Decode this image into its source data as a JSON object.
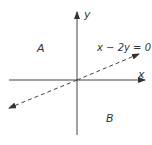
{
  "diagram": {
    "type": "coordinate-plane-with-line",
    "axes": {
      "x_label": "x",
      "y_label": "y"
    },
    "line": {
      "equation": "x − 2y = 0",
      "style": "dashed",
      "slope": 0.5,
      "intercept": 0
    },
    "regions": [
      {
        "label": "A",
        "position": "above line"
      },
      {
        "label": "B",
        "position": "below line"
      }
    ],
    "colors": {
      "ink": "#333333",
      "background": "#ffffff"
    }
  }
}
